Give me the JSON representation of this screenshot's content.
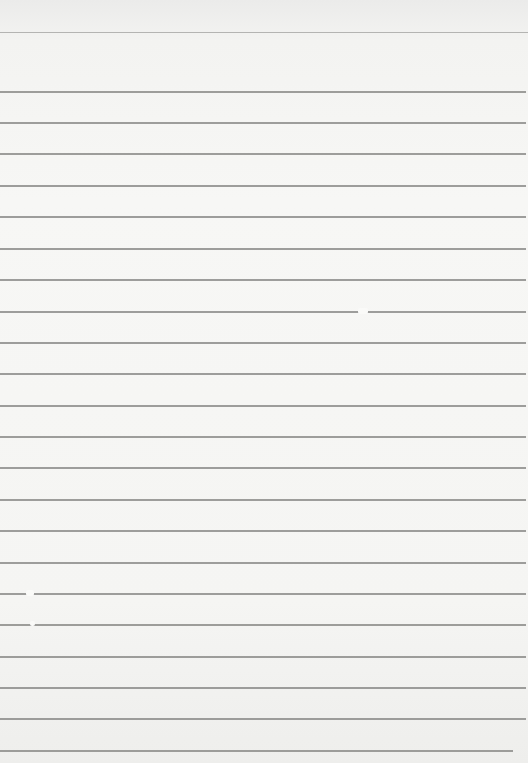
{
  "image": {
    "description": "Blank lined notebook paper",
    "background_color": "#f5f5f3",
    "rule_color": "#8d8d8b",
    "rules": [
      {
        "y": 32,
        "x2": 528,
        "type": "top"
      },
      {
        "y": 91,
        "x2": 526
      },
      {
        "y": 122,
        "x2": 526
      },
      {
        "y": 153,
        "x2": 526
      },
      {
        "y": 185,
        "x2": 526
      },
      {
        "y": 216,
        "x2": 526
      },
      {
        "y": 248,
        "x2": 526
      },
      {
        "y": 279,
        "x2": 526
      },
      {
        "y": 311,
        "x2": 526
      },
      {
        "y": 342,
        "x2": 526
      },
      {
        "y": 373,
        "x2": 526
      },
      {
        "y": 405,
        "x2": 526
      },
      {
        "y": 436,
        "x2": 526
      },
      {
        "y": 467,
        "x2": 526
      },
      {
        "y": 499,
        "x2": 526
      },
      {
        "y": 530,
        "x2": 526
      },
      {
        "y": 562,
        "x2": 526
      },
      {
        "y": 593,
        "x2": 526
      },
      {
        "y": 624,
        "x2": 526
      },
      {
        "y": 656,
        "x2": 526
      },
      {
        "y": 687,
        "x2": 526
      },
      {
        "y": 718,
        "x2": 526
      },
      {
        "y": 750,
        "x2": 513
      }
    ],
    "glare_spots": [
      {
        "x": 358,
        "y": 308,
        "w": 10,
        "h": 6
      },
      {
        "x": 26,
        "y": 590,
        "w": 8,
        "h": 6
      },
      {
        "x": 30,
        "y": 621,
        "w": 5,
        "h": 5
      }
    ]
  }
}
